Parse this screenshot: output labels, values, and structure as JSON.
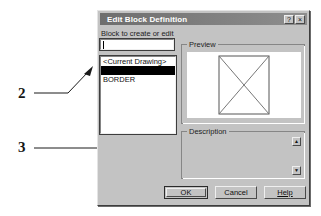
{
  "dialog": {
    "title": "Edit Block Definition",
    "titlebar_buttons": [
      {
        "name": "help-titlebar-button",
        "glyph": "?"
      },
      {
        "name": "close-titlebar-button",
        "glyph": "×"
      }
    ],
    "field_label": "Block to create or edit",
    "name_input": {
      "value": "",
      "placeholder": ""
    },
    "list": {
      "items": [
        {
          "label": "<Current Drawing>",
          "selected": false
        },
        {
          "label": "",
          "selected": true
        },
        {
          "label": "BORDER",
          "selected": false
        }
      ]
    },
    "preview": {
      "title": "Preview",
      "graphic": "rectangle-with-x-cross"
    },
    "description": {
      "title": "Description",
      "text": "",
      "scroll_up_glyph": "▲",
      "scroll_down_glyph": "▼"
    },
    "buttons": {
      "ok": "OK",
      "cancel": "Cancel",
      "help": "Help"
    }
  },
  "annotations": [
    {
      "number": "2",
      "target": "block-list"
    },
    {
      "number": "3",
      "target": "ok-button"
    }
  ],
  "colors": {
    "dialog_face": "#c3c3c3",
    "titlebar_start": "#6e6e6e",
    "titlebar_end": "#8e8e8e",
    "selection": "#000000",
    "field_bg": "#ffffff",
    "text": "#101010"
  }
}
